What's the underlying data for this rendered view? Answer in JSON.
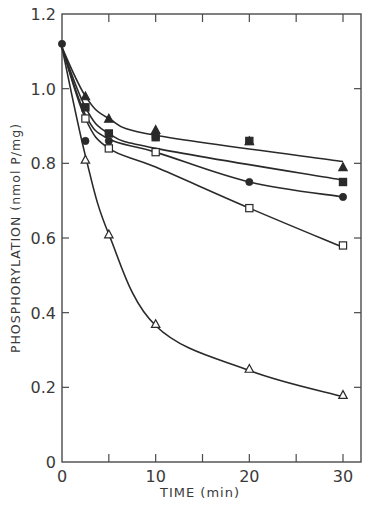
{
  "chart_data": {
    "type": "line",
    "title": "",
    "xlabel": "TIME (min)",
    "ylabel": "PHOSPHORYLATION (nmol P/mg)",
    "xlim": [
      0,
      31.5
    ],
    "ylim": [
      0,
      1.2
    ],
    "x_ticks": [
      0,
      10,
      20,
      30
    ],
    "x_minor_ticks": [
      5,
      15,
      25
    ],
    "y_ticks": [
      0,
      0.2,
      0.4,
      0.6,
      0.8,
      1.0,
      1.2
    ],
    "y_tick_labels": [
      "0",
      "0.2",
      "0.4",
      "0.6",
      "0.8",
      "1.0",
      "1.2"
    ],
    "grid": false,
    "legend": "none",
    "series": [
      {
        "name": "filled-triangle",
        "marker": "triangle-filled",
        "x": [
          0,
          2.5,
          5,
          10,
          20,
          30
        ],
        "values": [
          1.12,
          0.98,
          0.92,
          0.89,
          0.86,
          0.79
        ]
      },
      {
        "name": "filled-square",
        "marker": "square-filled",
        "x": [
          0,
          2.5,
          5,
          10,
          20,
          30
        ],
        "values": [
          1.12,
          0.95,
          0.88,
          0.87,
          0.86,
          0.75
        ]
      },
      {
        "name": "filled-circle",
        "marker": "circle-filled",
        "x": [
          0,
          2.5,
          5,
          10,
          20,
          30
        ],
        "values": [
          1.12,
          0.86,
          0.86,
          0.87,
          0.75,
          0.71
        ]
      },
      {
        "name": "open-square",
        "marker": "square-open",
        "x": [
          0,
          2.5,
          5,
          10,
          20,
          30
        ],
        "values": [
          1.12,
          0.92,
          0.84,
          0.83,
          0.68,
          0.58
        ]
      },
      {
        "name": "open-triangle",
        "marker": "triangle-open",
        "x": [
          0,
          2.5,
          5,
          10,
          20,
          30
        ],
        "values": [
          1.12,
          0.81,
          0.61,
          0.37,
          0.25,
          0.18
        ]
      }
    ],
    "curves": [
      {
        "series": "filled-triangle",
        "points": [
          [
            0,
            1.11
          ],
          [
            2.5,
            0.98
          ],
          [
            5,
            0.92
          ],
          [
            10,
            0.875
          ],
          [
            30,
            0.805
          ]
        ]
      },
      {
        "series": "filled-square",
        "points": [
          [
            0,
            1.11
          ],
          [
            2.5,
            0.95
          ],
          [
            5,
            0.88
          ],
          [
            10,
            0.84
          ],
          [
            30,
            0.755
          ]
        ]
      },
      {
        "series": "filled-circle",
        "points": [
          [
            0,
            1.11
          ],
          [
            2.5,
            0.93
          ],
          [
            5,
            0.865
          ],
          [
            10,
            0.83
          ],
          [
            20,
            0.75
          ],
          [
            30,
            0.71
          ]
        ]
      },
      {
        "series": "open-square",
        "points": [
          [
            0,
            1.11
          ],
          [
            2.5,
            0.92
          ],
          [
            5,
            0.84
          ],
          [
            10,
            0.79
          ],
          [
            20,
            0.68
          ],
          [
            30,
            0.575
          ]
        ]
      },
      {
        "series": "open-triangle",
        "points": [
          [
            0,
            1.11
          ],
          [
            2.5,
            0.82
          ],
          [
            5,
            0.61
          ],
          [
            10,
            0.365
          ],
          [
            20,
            0.245
          ],
          [
            30,
            0.175
          ]
        ]
      }
    ],
    "colors": {
      "line": "#2a2a2a",
      "axis": "#4a4a4a",
      "text": "#3a3a3a",
      "background": "#ffffff"
    }
  },
  "labels": {
    "xlabel": "TIME (min)",
    "ylabel": "PHOSPHORYLATION (nmol P/mg)"
  }
}
